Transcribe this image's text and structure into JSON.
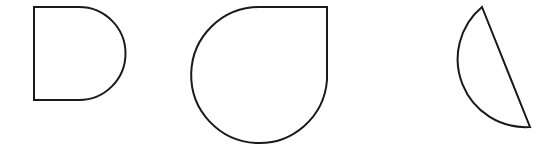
{
  "canvas": {
    "width": 551,
    "height": 153,
    "background": "#ffffff"
  },
  "style": {
    "stroke": "#1a1a1a",
    "stroke_width": 2,
    "fill": "#ffffff"
  },
  "shapes": [
    {
      "name": "semicircle-rectangle-shape",
      "description": "rectangle with rounded right side (D shape)",
      "path": "M34 7 L79 7 A46 46 0 0 1 79 100 L34 100 Z"
    },
    {
      "name": "teardrop-shape",
      "description": "circle with one square corner at top-right",
      "path": "M327 7 L327 80 A68 68 0 1 1 259 7 Z"
    },
    {
      "name": "circular-segment-shape",
      "description": "circle cut by a slanted chord",
      "path": "M482 7 L530 127 A68 68 0 0 1 482 7 Z"
    }
  ]
}
